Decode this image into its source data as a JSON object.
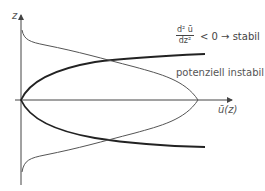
{
  "diagram": {
    "axes": {
      "y_label": "z",
      "x_label": "ū(z)"
    },
    "annotations": {
      "fraction_numerator": "d² ū",
      "fraction_denominator": "dz²",
      "condition": "< 0 → stabil",
      "unstable_label": "potenziell instabil"
    },
    "colors": {
      "thick_curve": "#222222",
      "thin_curve": "#555555",
      "axis": "#444444",
      "text": "#555555"
    }
  }
}
